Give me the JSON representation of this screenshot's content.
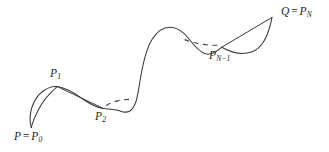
{
  "figure": {
    "kind": "spline-curve-diagram",
    "background_color": "#ffffff",
    "stroke_color": "#3a3a3c",
    "label_color": "#1d1d1f",
    "width": 329,
    "height": 152
  },
  "labels": {
    "start_point": {
      "text": "P = P0",
      "base": "P",
      "equals": "=",
      "second_base": "P",
      "subscript": "0",
      "x": 14,
      "y": 131
    },
    "control_point_1": {
      "text": "P1",
      "base": "P",
      "subscript": "1",
      "x": 50,
      "y": 68
    },
    "control_point_2": {
      "text": "P2",
      "base": "P",
      "subscript": "2",
      "x": 95,
      "y": 111
    },
    "control_point_n_minus_1": {
      "text": "PN-1",
      "base": "P",
      "subscript": "N−1",
      "x": 209,
      "y": 50
    },
    "end_point": {
      "text": "Q = PN",
      "base": "Q",
      "equals": "=",
      "second_base": "P",
      "subscript": "N",
      "x": 281,
      "y": 6
    }
  },
  "geometry": {
    "curve_main": "M 31.2 127.4 C 27.6 114.0 33.0 98.5 43.2 91.0 C 49.0 86.8 54.0 86.0 57.4 86.6 C 66.0 88.0 74.5 93.0 82.0 98.5 C 90.0 104.2 96.5 107.4 103.2 108.4 C 110.5 109.4 116.5 109.8 120.5 111.2 C 124.0 112.4 126.6 113.0 129.8 111.0 C 136.0 107.0 137.6 96.0 139.5 84.0 C 142.2 66.5 145.5 50.0 152.0 39.5 C 157.8 30.2 165.5 26.6 172.5 27.5 C 179.5 28.4 184.8 33.5 189.0 39.0 C 194.5 46.2 199.5 52.0 205.5 53.8 C 211.0 55.4 216.5 52.0 221.8 47.2",
    "curve_start_cusp_return": "M 31.2 127.4 C 34.2 116.0 41.8 102.0 48.8 94.8 C 52.6 90.8 55.8 87.8 57.4 86.6",
    "chord_p1_p2": "M 57.4 86.6 L 103.2 108.4",
    "hook_chord": "M 221.8 47.2 L 272.0 17.4",
    "hook_curve": "M 221.8 47.2 C 231.0 52.5 242.0 55.0 251.5 52.0 C 261.5 48.8 268.5 36.0 272.0 17.4",
    "dash_left": "M 106.0 105.5 C 114.0 100.8 124.0 98.8 133.4 99.6",
    "dash_right": "M 184.6 39.6 C 194.0 43.4 205.0 45.6 217.8 45.2"
  }
}
